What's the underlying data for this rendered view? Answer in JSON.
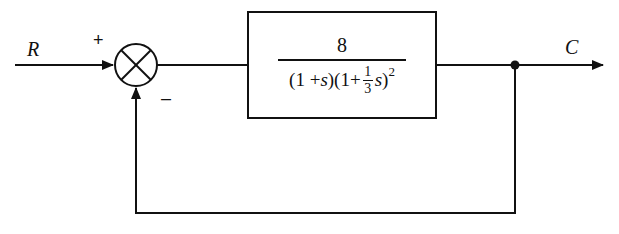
{
  "diagram": {
    "type": "feedback-control-block-diagram",
    "input_label": "R",
    "output_label": "C",
    "summing_junction": {
      "plus_sign": "+",
      "minus_sign": "–"
    },
    "transfer_function": {
      "numerator": "8",
      "denominator": {
        "open1": "(1 + ",
        "var1": "s",
        "close1": ")(1+",
        "frac_num": "1",
        "frac_den": "3",
        "var2": "s",
        "close2": ")",
        "exponent": "2"
      }
    },
    "feedback": "unity negative feedback",
    "colors": {
      "line": "#111111",
      "background": "#ffffff"
    }
  }
}
